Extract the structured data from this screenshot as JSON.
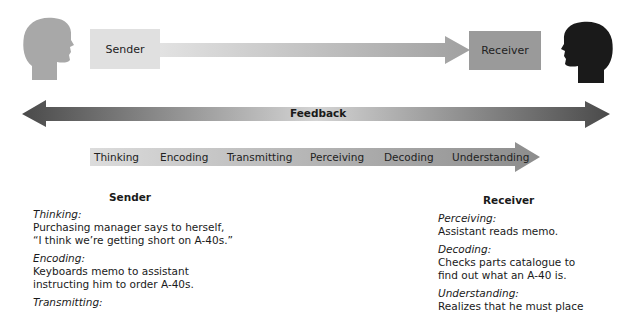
{
  "sender_box": {
    "label": "Sender",
    "color": "#e0e0e0"
  },
  "receiver_box": {
    "label": "Receiver",
    "color": "#9a9a9a"
  },
  "sender_head": {
    "icon": "head-silhouette-icon",
    "color": "#a8a8a8"
  },
  "receiver_head": {
    "icon": "head-silhouette-icon",
    "color": "#1a1a1a"
  },
  "feedback": {
    "label": "Feedback"
  },
  "process": {
    "stages": [
      "Thinking",
      "Encoding",
      "Transmitting",
      "Perceiving",
      "Decoding",
      "Understanding"
    ]
  },
  "sender_column": {
    "title": "Sender",
    "items": [
      {
        "heading": "Thinking:",
        "lines": [
          "Purchasing manager says to herself,",
          "“I think we’re getting short on A-40s.”"
        ]
      },
      {
        "heading": "Encoding:",
        "lines": [
          "Keyboards memo to assistant",
          "instructing him to order A-40s."
        ]
      },
      {
        "heading": "Transmitting:",
        "lines": []
      }
    ]
  },
  "receiver_column": {
    "title": "Receiver",
    "items": [
      {
        "heading": "Perceiving:",
        "lines": [
          "Assistant reads memo."
        ]
      },
      {
        "heading": "Decoding:",
        "lines": [
          "Checks parts catalogue to",
          "find out what an A-40 is."
        ]
      },
      {
        "heading": "Understanding:",
        "lines": [
          "Realizes that he must place"
        ]
      }
    ]
  }
}
